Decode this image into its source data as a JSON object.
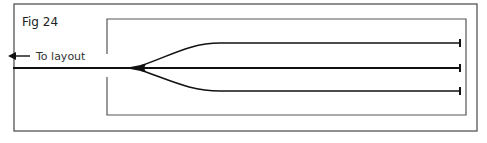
{
  "figure": {
    "title": "Fig 24",
    "arrow_label": "To layout",
    "arrow_direction": "left",
    "tracks": [
      {
        "name": "upper-siding",
        "y": 43
      },
      {
        "name": "middle-siding",
        "y": 68
      },
      {
        "name": "lower-siding",
        "y": 91
      }
    ],
    "colors": {
      "line": "#111111",
      "frame": "#444444",
      "background": "#ffffff"
    }
  }
}
